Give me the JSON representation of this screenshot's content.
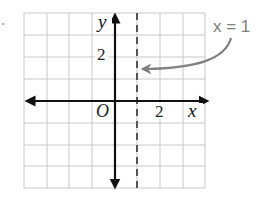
{
  "graph": {
    "y_axis_label": "y",
    "x_axis_label": "x",
    "origin_label": "O",
    "y_tick_label": "2",
    "x_tick_label": "2",
    "annotation": "x = 1",
    "grid": {
      "columns": 8,
      "rows": 8,
      "x_min": -4,
      "x_max": 4,
      "y_min": -4,
      "y_max": 4
    },
    "dashed_line": {
      "equation": "x = 1",
      "x": 1
    },
    "colors": {
      "grid": "#c8c8c8",
      "axes": "#111111",
      "dashed_line": "#555555",
      "annotation": "#808080"
    }
  }
}
